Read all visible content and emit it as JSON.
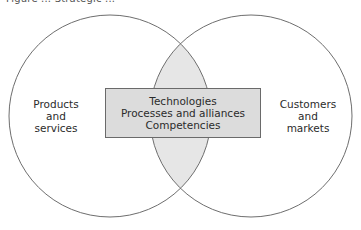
{
  "figure": {
    "title_partial": "Figure ... Strategic ..."
  },
  "diagram": {
    "type": "venn",
    "circles": [
      {
        "id": "left",
        "label_lines": [
          "Products",
          "and",
          "services"
        ],
        "cx": 110,
        "cy": 116,
        "r": 101
      },
      {
        "id": "right",
        "label_lines": [
          "Customers",
          "and",
          "markets"
        ],
        "cx": 251,
        "cy": 116,
        "r": 101
      }
    ],
    "intersection": {
      "label_lines": [
        "Technologies",
        "Processes and alliances",
        "Competencies"
      ]
    },
    "colors": {
      "circle_stroke": "#6e6e6e",
      "circle_fill": "#ffffff",
      "intersection_fill": "#e6e6e6",
      "box_fill": "#dcdcdc",
      "box_stroke": "#6a6a6a",
      "text": "#2b2b2b"
    }
  }
}
